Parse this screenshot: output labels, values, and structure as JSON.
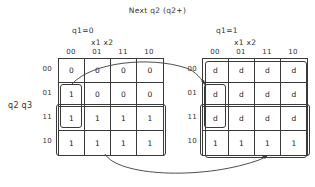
{
  "title": "Next q2 (q2+)",
  "row_axis_label": "q2 q3",
  "row_headers": [
    "00",
    "01",
    "11",
    "10"
  ],
  "maps": [
    {
      "name": "left-kmap",
      "condition_label": "q1=0",
      "column_axis_label": "x1 x2",
      "column_headers": [
        "00",
        "01",
        "11",
        "10"
      ],
      "rows": [
        [
          "0",
          "0",
          "0",
          "0"
        ],
        [
          "1",
          "0",
          "0",
          "0"
        ],
        [
          "1",
          "1",
          "1",
          "1"
        ],
        [
          "1",
          "1",
          "1",
          "1"
        ]
      ],
      "groups": [
        {
          "name": "group-col00-rows01-11",
          "shape": "vertical-pair"
        },
        {
          "name": "group-rows11-10-all-columns",
          "shape": "wide-two-row"
        }
      ]
    },
    {
      "name": "right-kmap",
      "condition_label": "q1=1",
      "column_axis_label": "x1 x2",
      "column_headers": [
        "00",
        "01",
        "11",
        "10"
      ],
      "rows": [
        [
          "d",
          "d",
          "d",
          "d"
        ],
        [
          "d",
          "d",
          "d",
          "d"
        ],
        [
          "d",
          "d",
          "d",
          "d"
        ],
        [
          "1",
          "1",
          "1",
          "1"
        ]
      ],
      "groups": [
        {
          "name": "group-col00-rows01-11",
          "shape": "vertical-pair"
        },
        {
          "name": "group-rows11-10-all-columns",
          "shape": "wide-two-row"
        },
        {
          "name": "group-rows00-11-all-columns",
          "shape": "outer-three-row"
        }
      ]
    }
  ],
  "connectors": [
    {
      "name": "upper-arc-connector",
      "from": "left-kmap-cell-r01-c00",
      "to": "right-kmap-cell-r01-c00"
    },
    {
      "name": "lower-arc-connector",
      "from": "left-kmap-group-bottom",
      "to": "right-kmap-group-bottom"
    }
  ]
}
